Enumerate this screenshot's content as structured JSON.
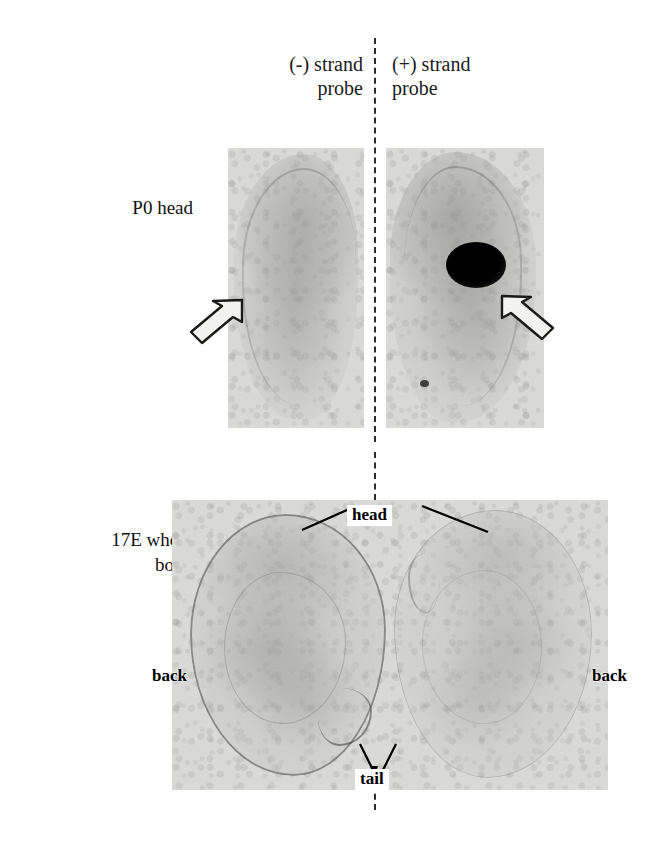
{
  "figure": {
    "background_color": "#ffffff",
    "film_color": "#d9d9d7",
    "ink_color": "#000000"
  },
  "columns": [
    {
      "id": "negative-strand",
      "label": "(-) strand\nprobe"
    },
    {
      "id": "positive-strand",
      "label": "(+) strand\nprobe"
    }
  ],
  "rows": [
    {
      "id": "p0-head",
      "label": "P0 head"
    },
    {
      "id": "17e-whole-body",
      "label": "17E whole\nbody"
    }
  ],
  "panels": {
    "p0_negative": {
      "name": "P0 head, (-) strand probe",
      "arrow": {
        "name": "arrow-pointer",
        "direction": "up-right",
        "style": "white-open-arrow"
      },
      "signal": "none"
    },
    "p0_positive": {
      "name": "P0 head, (+) strand probe",
      "arrow": {
        "name": "arrow-pointer",
        "direction": "up-left",
        "style": "white-open-arrow"
      },
      "signal": "dark-hybridization-spot"
    },
    "e17_negative": {
      "name": "17E whole body, (-) strand probe"
    },
    "e17_positive": {
      "name": "17E whole body, (+) strand probe"
    }
  },
  "annotations": [
    {
      "id": "head",
      "label": "head"
    },
    {
      "id": "tail",
      "label": "tail"
    },
    {
      "id": "back-left",
      "label": "back"
    },
    {
      "id": "back-right",
      "label": "back"
    }
  ],
  "divider": {
    "name": "center-dashed-divider",
    "style": "dashed",
    "color": "#2b2b2b"
  }
}
